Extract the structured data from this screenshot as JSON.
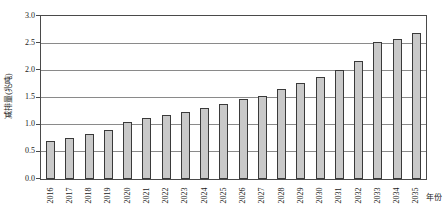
{
  "figure": {
    "background": "#ffffff",
    "text_color": "#1a1a1a"
  },
  "chart_data": {
    "type": "bar",
    "title": "",
    "categories": [
      "2016",
      "2017",
      "2018",
      "2019",
      "2020",
      "2021",
      "2022",
      "2023",
      "2024",
      "2025",
      "2026",
      "2027",
      "2028",
      "2029",
      "2030",
      "2031",
      "2032",
      "2033",
      "2034",
      "2035"
    ],
    "values": [
      0.7,
      0.76,
      0.82,
      0.91,
      1.04,
      1.13,
      1.18,
      1.24,
      1.3,
      1.38,
      1.47,
      1.53,
      1.66,
      1.77,
      1.87,
      2.0,
      2.18,
      2.52,
      2.58,
      2.68
    ],
    "xlabel": "年份",
    "ylabel": "减排量(兆吨)",
    "ylim": [
      0,
      3.0
    ],
    "yticks": [
      "0.0",
      "0.5",
      "1.0",
      "1.5",
      "2.0",
      "2.5",
      "3.0"
    ],
    "grid": true,
    "legend": "none",
    "bar_fill": "#c9c9c9",
    "bar_border": "#3a3a3a",
    "gridline_color": "#8a8a8a",
    "axis_color": "#4a4a4a"
  }
}
